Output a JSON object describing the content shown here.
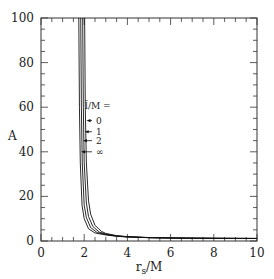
{
  "chart_data": {
    "type": "line",
    "title": "",
    "xlabel": "r_s/M",
    "ylabel": "A",
    "xlim": [
      0,
      10
    ],
    "ylim": [
      0,
      100
    ],
    "xticks": [
      0,
      2,
      4,
      6,
      8,
      10
    ],
    "yticks": [
      0,
      20,
      40,
      60,
      80,
      100
    ],
    "grid": false,
    "legend_title": "l̃/M =",
    "legend_position": "inside-left-middle",
    "series": [
      {
        "name": "0",
        "x": [
          2.02,
          2.05,
          2.1,
          2.2,
          2.3,
          2.5,
          2.8,
          3,
          3.5,
          4,
          5,
          6,
          7,
          8,
          9,
          10
        ],
        "y": [
          100,
          60,
          35,
          18,
          12,
          7,
          4.3,
          3.4,
          2.4,
          1.95,
          1.55,
          1.38,
          1.28,
          1.22,
          1.18,
          1.15
        ]
      },
      {
        "name": "1",
        "x": [
          1.93,
          1.96,
          2.0,
          2.1,
          2.2,
          2.4,
          2.7,
          3,
          3.5,
          4,
          5,
          6,
          7,
          8,
          9,
          10
        ],
        "y": [
          100,
          60,
          35,
          17,
          11,
          6.5,
          4.0,
          3.1,
          2.3,
          1.9,
          1.52,
          1.36,
          1.27,
          1.21,
          1.17,
          1.14
        ]
      },
      {
        "name": "2",
        "x": [
          1.84,
          1.87,
          1.91,
          2.0,
          2.1,
          2.3,
          2.6,
          3,
          3.5,
          4,
          5,
          6,
          7,
          8,
          9,
          10
        ],
        "y": [
          100,
          60,
          35,
          16,
          10.5,
          6,
          3.8,
          2.9,
          2.2,
          1.85,
          1.5,
          1.35,
          1.26,
          1.2,
          1.16,
          1.13
        ]
      },
      {
        "name": "∞",
        "x": [
          1.75,
          1.78,
          1.82,
          1.9,
          2.0,
          2.2,
          2.5,
          3,
          3.5,
          4,
          5,
          6,
          7,
          8,
          9,
          10
        ],
        "y": [
          100,
          60,
          35,
          16,
          10,
          5.5,
          3.6,
          2.7,
          2.1,
          1.8,
          1.48,
          1.33,
          1.25,
          1.19,
          1.15,
          1.12
        ]
      }
    ],
    "annotations": [
      {
        "label": "0",
        "arrow_y": 54
      },
      {
        "label": "1",
        "arrow_y": 49
      },
      {
        "label": "2",
        "arrow_y": 45
      },
      {
        "label": "∞",
        "arrow_y": 40
      }
    ]
  }
}
